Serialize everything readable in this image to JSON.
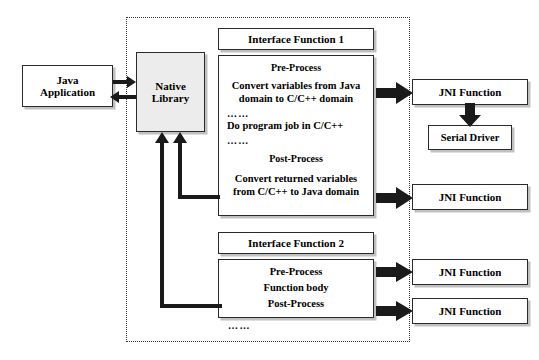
{
  "diagram": {
    "nodes": {
      "java_application": "Java\nApplication",
      "java_application_line1": "Java",
      "java_application_line2": "Application",
      "native_library_line1": "Native",
      "native_library_line2": "Library",
      "serial_driver": "Serial Driver",
      "jni_function_1": "JNI Function",
      "jni_function_2": "JNI Function",
      "jni_function_3": "JNI Function",
      "jni_function_4": "JNI Function"
    },
    "interface_function_1": {
      "header": "Interface Function 1",
      "lines": [
        "Pre-Process",
        "Convert variables from Java",
        "domain to C/C++ domain",
        "……",
        "Do program job in C/C++",
        "……",
        "Post-Process",
        "Convert returned variables",
        "from C/C++ to Java domain"
      ]
    },
    "interface_function_2": {
      "header": "Interface Function 2",
      "lines": [
        "Pre-Process",
        "Function body",
        "Post-Process"
      ]
    },
    "more_indicator": "……",
    "colors": {
      "outline": "#2b2b2b",
      "shaded_fill": "#ececec",
      "arrow_fill": "#1a1a1a",
      "dotted_border": "#3a3a3a",
      "background": "#ffffff"
    }
  }
}
